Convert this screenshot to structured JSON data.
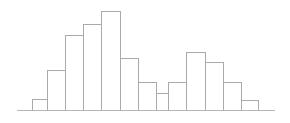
{
  "chart": {
    "background_color": "#ffffff",
    "bar_stroke_color": "#aaaaaa",
    "bar_fill_color": "#ffffff",
    "axis_color": "#b5b5b5",
    "stroke_width": 1
  },
  "chart_data": {
    "type": "bar",
    "title": "",
    "subtitle": "",
    "xlabel": "",
    "ylabel": "",
    "grid": false,
    "legend": false,
    "legend_position": "none",
    "axis": {
      "baseline_y_px": 110,
      "baseline_x_start_px": 17,
      "baseline_x_end_px": 275,
      "plot_top_px": 11,
      "bar_width_px": 18,
      "first_bar_left_px": 32
    },
    "xlim": [
      0,
      14
    ],
    "ylim": [
      0,
      100
    ],
    "categories": [
      "1",
      "2",
      "3",
      "4",
      "5",
      "6",
      "7",
      "8",
      "9",
      "10",
      "11",
      "12",
      "13",
      "14"
    ],
    "values": [
      11,
      40,
      76,
      87,
      100,
      52,
      28,
      17,
      28,
      59,
      48,
      28,
      28,
      10
    ],
    "bars_px": [
      {
        "index": 0,
        "x": 32,
        "width": 15,
        "top_y": 99,
        "height": 11
      },
      {
        "index": 1,
        "x": 47,
        "width": 18,
        "top_y": 70,
        "height": 40
      },
      {
        "index": 2,
        "x": 65,
        "width": 18,
        "top_y": 35,
        "height": 75
      },
      {
        "index": 3,
        "x": 83,
        "width": 18,
        "top_y": 24,
        "height": 86
      },
      {
        "index": 4,
        "x": 101,
        "width": 19,
        "top_y": 11,
        "height": 99
      },
      {
        "index": 5,
        "x": 120,
        "width": 18,
        "top_y": 58,
        "height": 52
      },
      {
        "index": 6,
        "x": 138,
        "width": 18,
        "top_y": 82,
        "height": 28
      },
      {
        "index": 7,
        "x": 156,
        "width": 12,
        "top_y": 93,
        "height": 17
      },
      {
        "index": 8,
        "x": 168,
        "width": 18,
        "top_y": 82,
        "height": 28
      },
      {
        "index": 9,
        "x": 186,
        "width": 19,
        "top_y": 52,
        "height": 58
      },
      {
        "index": 10,
        "x": 205,
        "width": 18,
        "top_y": 62,
        "height": 48
      },
      {
        "index": 11,
        "x": 223,
        "width": 18,
        "top_y": 82,
        "height": 28
      },
      {
        "index": 12,
        "x": 241,
        "width": 17,
        "top_y": 100,
        "height": 10
      }
    ]
  }
}
